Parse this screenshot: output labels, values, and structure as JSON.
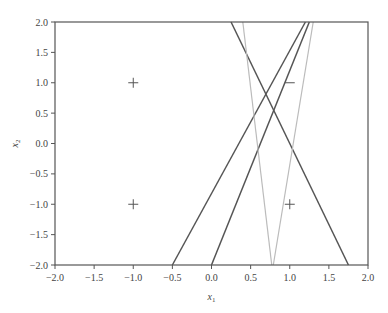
{
  "chart_data": {
    "type": "line",
    "title": "",
    "xlabel": "x",
    "xlabel_sub": "1",
    "ylabel": "x",
    "ylabel_sub": "2",
    "xlim": [
      -2.0,
      2.0
    ],
    "ylim": [
      -2.0,
      2.0
    ],
    "grid": false,
    "legend": null,
    "xticks": [
      "−2.0",
      "−1.5",
      "−1.0",
      "−0.5",
      "0.0",
      "0.5",
      "1.0",
      "1.5",
      "2.0"
    ],
    "xtick_values": [
      -2.0,
      -1.5,
      -1.0,
      -0.5,
      0.0,
      0.5,
      1.0,
      1.5,
      2.0
    ],
    "yticks": [
      "2.0",
      "1.5",
      "1.0",
      "0.5",
      "0.0",
      "−0.5",
      "−1.0",
      "−1.5",
      "−2.0"
    ],
    "ytick_values": [
      2.0,
      1.5,
      1.0,
      0.5,
      0.0,
      -0.5,
      -1.0,
      -1.5,
      -2.0
    ],
    "points": [
      {
        "x": -1,
        "y": 1,
        "label": "+"
      },
      {
        "x": -1,
        "y": -1,
        "label": "+"
      },
      {
        "x": 1,
        "y": 1,
        "label": "−"
      },
      {
        "x": 1,
        "y": -1,
        "label": "+"
      }
    ],
    "series": [
      {
        "name": "line-dark-1",
        "color": "#555555",
        "x": [
          -0.5,
          1.2
        ],
        "y": [
          -2.0,
          2.0
        ]
      },
      {
        "name": "line-dark-2",
        "color": "#555555",
        "x": [
          0.0,
          1.25
        ],
        "y": [
          -2.0,
          2.0
        ]
      },
      {
        "name": "line-dark-3",
        "color": "#555555",
        "x": [
          0.25,
          1.75
        ],
        "y": [
          2.0,
          -2.0
        ]
      },
      {
        "name": "line-light-1",
        "color": "#bbbbbb",
        "x": [
          0.4,
          0.77
        ],
        "y": [
          2.0,
          -2.0
        ]
      },
      {
        "name": "line-light-2",
        "color": "#bbbbbb",
        "x": [
          1.3,
          0.79
        ],
        "y": [
          2.0,
          -2.0
        ]
      }
    ]
  },
  "colors": {
    "axis": "#555555",
    "dark_line": "#555555",
    "light_line": "#bbbbbb",
    "marker": "#555555"
  }
}
